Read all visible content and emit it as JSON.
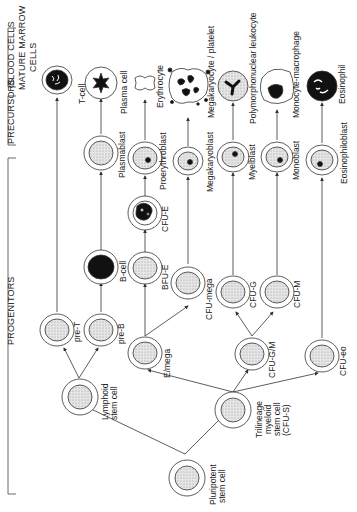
{
  "sections": {
    "progenitors": "PROGENITORS",
    "precursors": "PRECURSORS",
    "blood_cells": "BLOOD CELLS",
    "mature_marrow_line1": "MATURE MARROW",
    "mature_marrow_line2": "CELLS"
  },
  "mature_cells": {
    "t_cell": "T-cell",
    "plasma_cell": "Plasma cell",
    "erythrocyte": "Erythrocyte",
    "megakaryocyte": "Megakaryocyte / platelet",
    "polymorph": "Polymorphonuclear leukocyte",
    "monocyte": "Monocyte-macrophage",
    "eosinophil": "Eosinophil"
  },
  "precursor_cells": {
    "plasmablast": "Plasmablast",
    "cfu_e": "CFU-E",
    "proerythroblast": "Proerythroblast",
    "megakaryoblast": "Megakaryoblast",
    "myelblast": "Myelblast",
    "monoblast": "Monoblast",
    "eosinophiloblast": "Eosinophiloblast"
  },
  "progenitor_cells": {
    "pre_t": "pre-T",
    "pre_b": "pre-B",
    "b_cell": "B-cell",
    "bfu_e": "BFU-E",
    "e_mega": "E/mega",
    "cfu_mega": "CFU-mega",
    "cfu_g": "CFU-G",
    "cfu_m": "CFU-M",
    "cfu_gm": "CFU-G/M",
    "cfu_eo": "CFU-eo",
    "lymphoid_line1": "Lymphoid",
    "lymphoid_line2": "stem cell",
    "trilineage_line1": "Trilineage",
    "trilineage_line2": "myeloid",
    "trilineage_line3": "stem cell",
    "trilineage_line4": "(CFU-S)",
    "pluripotent_line1": "Pluripotent",
    "pluripotent_line2": "stem cell"
  },
  "colors": {
    "line": "#333333",
    "stipple": "#cfcfcf",
    "nucleus": "#111111"
  }
}
